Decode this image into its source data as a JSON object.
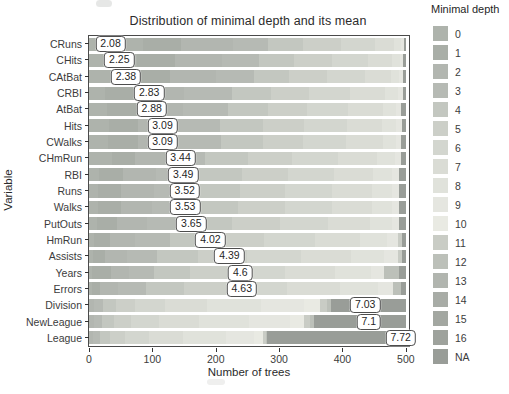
{
  "title": "Distribution of minimal depth and its mean",
  "legend": {
    "title": "Minimal depth",
    "labels": [
      "0",
      "1",
      "2",
      "3",
      "4",
      "5",
      "6",
      "7",
      "8",
      "9",
      "10",
      "11",
      "12",
      "13",
      "14",
      "15",
      "16",
      "NA"
    ]
  },
  "chart_data": {
    "type": "bar",
    "orientation": "horizontal",
    "stacked": true,
    "title": "Distribution of minimal depth and its mean",
    "xlabel": "Number of trees",
    "ylabel": "Variable",
    "xlim": [
      0,
      505
    ],
    "xticks": [
      0,
      100,
      200,
      300,
      400,
      500
    ],
    "total_trees_per_row": 500,
    "legend_title": "Minimal depth",
    "legend_position": "right",
    "grid": false,
    "depth_colors": {
      "0": "#aeb3ac",
      "1": "#a9aea7",
      "2": "#b2b6b0",
      "3": "#b6bab4",
      "4": "#c3c7c0",
      "5": "#cccfc8",
      "6": "#d3d6cf",
      "7": "#dadcd5",
      "8": "#e0e2db",
      "9": "#e5e6e0",
      "10": "#e9eae3",
      "11": "#c9ccc5",
      "12": "#bcc0b9",
      "13": "#b1b5af",
      "14": "#a8aca6",
      "15": "#a3a7a1",
      "16": "#9ea29c",
      "NA": "#999d98"
    },
    "rows": [
      {
        "variable": "CRuns",
        "mean_label": "2.08",
        "mean": 2.08,
        "segments": [
          [
            "0",
            85
          ],
          [
            "1",
            60
          ],
          [
            "2",
            82
          ],
          [
            "3",
            55
          ],
          [
            "4",
            55
          ],
          [
            "5",
            60
          ],
          [
            "6",
            55
          ],
          [
            "7",
            30
          ],
          [
            "8",
            10
          ],
          [
            "9",
            5
          ],
          [
            "NA",
            3
          ]
        ]
      },
      {
        "variable": "CHits",
        "mean_label": "2.25",
        "mean": 2.25,
        "segments": [
          [
            "0",
            75
          ],
          [
            "1",
            60
          ],
          [
            "2",
            75
          ],
          [
            "3",
            58
          ],
          [
            "4",
            55
          ],
          [
            "5",
            60
          ],
          [
            "6",
            58
          ],
          [
            "7",
            38
          ],
          [
            "8",
            12
          ],
          [
            "9",
            5
          ],
          [
            "NA",
            4
          ]
        ]
      },
      {
        "variable": "CAtBat",
        "mean_label": "2.38",
        "mean": 2.38,
        "segments": [
          [
            "0",
            70
          ],
          [
            "1",
            58
          ],
          [
            "2",
            72
          ],
          [
            "3",
            60
          ],
          [
            "4",
            56
          ],
          [
            "5",
            60
          ],
          [
            "6",
            60
          ],
          [
            "7",
            40
          ],
          [
            "8",
            14
          ],
          [
            "9",
            6
          ],
          [
            "NA",
            4
          ]
        ]
      },
      {
        "variable": "CRBI",
        "mean_label": "2.83",
        "mean": 2.83,
        "segments": [
          [
            "0",
            25
          ],
          [
            "1",
            55
          ],
          [
            "2",
            70
          ],
          [
            "3",
            75
          ],
          [
            "4",
            62
          ],
          [
            "5",
            60
          ],
          [
            "6",
            65
          ],
          [
            "7",
            55
          ],
          [
            "8",
            20
          ],
          [
            "9",
            8
          ],
          [
            "NA",
            5
          ]
        ]
      },
      {
        "variable": "AtBat",
        "mean_label": "2.88",
        "mean": 2.88,
        "segments": [
          [
            "0",
            28
          ],
          [
            "1",
            52
          ],
          [
            "2",
            68
          ],
          [
            "3",
            72
          ],
          [
            "4",
            62
          ],
          [
            "5",
            62
          ],
          [
            "6",
            65
          ],
          [
            "7",
            55
          ],
          [
            "8",
            20
          ],
          [
            "9",
            9
          ],
          [
            "NA",
            7
          ]
        ]
      },
      {
        "variable": "Hits",
        "mean_label": "3.09",
        "mean": 3.09,
        "segments": [
          [
            "0",
            32
          ],
          [
            "1",
            45
          ],
          [
            "2",
            60
          ],
          [
            "3",
            70
          ],
          [
            "4",
            68
          ],
          [
            "5",
            65
          ],
          [
            "6",
            68
          ],
          [
            "7",
            55
          ],
          [
            "8",
            22
          ],
          [
            "9",
            9
          ],
          [
            "NA",
            6
          ]
        ]
      },
      {
        "variable": "CWalks",
        "mean_label": "3.09",
        "mean": 3.09,
        "segments": [
          [
            "0",
            30
          ],
          [
            "1",
            48
          ],
          [
            "2",
            62
          ],
          [
            "3",
            68
          ],
          [
            "4",
            66
          ],
          [
            "5",
            64
          ],
          [
            "6",
            68
          ],
          [
            "7",
            58
          ],
          [
            "8",
            20
          ],
          [
            "9",
            9
          ],
          [
            "NA",
            7
          ]
        ]
      },
      {
        "variable": "CHmRun",
        "mean_label": "3.44",
        "mean": 3.44,
        "segments": [
          [
            "0",
            37
          ],
          [
            "1",
            36
          ],
          [
            "2",
            50
          ],
          [
            "3",
            60
          ],
          [
            "4",
            68
          ],
          [
            "5",
            70
          ],
          [
            "6",
            72
          ],
          [
            "7",
            62
          ],
          [
            "8",
            28
          ],
          [
            "9",
            10
          ],
          [
            "NA",
            7
          ]
        ]
      },
      {
        "variable": "RBI",
        "mean_label": "3.49",
        "mean": 3.49,
        "segments": [
          [
            "0",
            15
          ],
          [
            "1",
            38
          ],
          [
            "2",
            52
          ],
          [
            "3",
            65
          ],
          [
            "4",
            72
          ],
          [
            "5",
            72
          ],
          [
            "6",
            72
          ],
          [
            "7",
            62
          ],
          [
            "8",
            30
          ],
          [
            "9",
            12
          ],
          [
            "NA",
            10
          ]
        ]
      },
      {
        "variable": "Runs",
        "mean_label": "3.52",
        "mean": 3.52,
        "segments": [
          [
            "0",
            14
          ],
          [
            "1",
            36
          ],
          [
            "2",
            52
          ],
          [
            "3",
            64
          ],
          [
            "4",
            72
          ],
          [
            "5",
            72
          ],
          [
            "6",
            74
          ],
          [
            "7",
            62
          ],
          [
            "8",
            32
          ],
          [
            "9",
            12
          ],
          [
            "NA",
            10
          ]
        ]
      },
      {
        "variable": "Walks",
        "mean_label": "3.53",
        "mean": 3.53,
        "segments": [
          [
            "0",
            14
          ],
          [
            "1",
            36
          ],
          [
            "2",
            50
          ],
          [
            "3",
            64
          ],
          [
            "4",
            72
          ],
          [
            "5",
            74
          ],
          [
            "6",
            74
          ],
          [
            "7",
            62
          ],
          [
            "8",
            32
          ],
          [
            "9",
            12
          ],
          [
            "NA",
            10
          ]
        ]
      },
      {
        "variable": "PutOuts",
        "mean_label": "3.65",
        "mean": 3.65,
        "segments": [
          [
            "0",
            12
          ],
          [
            "1",
            32
          ],
          [
            "2",
            48
          ],
          [
            "3",
            62
          ],
          [
            "4",
            72
          ],
          [
            "5",
            76
          ],
          [
            "6",
            76
          ],
          [
            "7",
            66
          ],
          [
            "8",
            34
          ],
          [
            "9",
            12
          ],
          [
            "NA",
            10
          ]
        ]
      },
      {
        "variable": "HmRun",
        "mean_label": "4.02",
        "mean": 4.02,
        "segments": [
          [
            "0",
            8
          ],
          [
            "1",
            25
          ],
          [
            "2",
            40
          ],
          [
            "3",
            55
          ],
          [
            "4",
            70
          ],
          [
            "5",
            78
          ],
          [
            "6",
            80
          ],
          [
            "7",
            72
          ],
          [
            "8",
            42
          ],
          [
            "9",
            18
          ],
          [
            "11",
            6
          ],
          [
            "NA",
            6
          ]
        ]
      },
      {
        "variable": "Assists",
        "mean_label": "4.39",
        "mean": 4.39,
        "segments": [
          [
            "0",
            6
          ],
          [
            "1",
            20
          ],
          [
            "2",
            34
          ],
          [
            "3",
            48
          ],
          [
            "4",
            64
          ],
          [
            "5",
            78
          ],
          [
            "6",
            84
          ],
          [
            "7",
            80
          ],
          [
            "8",
            52
          ],
          [
            "9",
            22
          ],
          [
            "11",
            6
          ],
          [
            "NA",
            6
          ]
        ]
      },
      {
        "variable": "Years",
        "mean_label": "4.6",
        "mean": 4.6,
        "segments": [
          [
            "0",
            5
          ],
          [
            "1",
            30
          ],
          [
            "2",
            28
          ],
          [
            "3",
            40
          ],
          [
            "4",
            56
          ],
          [
            "5",
            70
          ],
          [
            "6",
            80
          ],
          [
            "7",
            80
          ],
          [
            "8",
            56
          ],
          [
            "9",
            20
          ],
          [
            "12",
            25
          ],
          [
            "NA",
            10
          ]
        ]
      },
      {
        "variable": "Errors",
        "mean_label": "4.63",
        "mean": 4.63,
        "segments": [
          [
            "0",
            4
          ],
          [
            "1",
            14
          ],
          [
            "2",
            28
          ],
          [
            "3",
            44
          ],
          [
            "4",
            60
          ],
          [
            "5",
            76
          ],
          [
            "6",
            86
          ],
          [
            "7",
            84
          ],
          [
            "8",
            60
          ],
          [
            "9",
            24
          ],
          [
            "12",
            12
          ],
          [
            "NA",
            8
          ]
        ]
      },
      {
        "variable": "Division",
        "mean_label": "7.03",
        "mean": 7.03,
        "segments": [
          [
            "2",
            8
          ],
          [
            "3",
            14
          ],
          [
            "4",
            20
          ],
          [
            "5",
            30
          ],
          [
            "6",
            48
          ],
          [
            "7",
            66
          ],
          [
            "8",
            86
          ],
          [
            "9",
            68
          ],
          [
            "10",
            25
          ],
          [
            "11",
            11
          ],
          [
            "12",
            6
          ],
          [
            "NA",
            118
          ]
        ]
      },
      {
        "variable": "NewLeague",
        "mean_label": "7.1",
        "mean": 7.1,
        "segments": [
          [
            "2",
            8
          ],
          [
            "3",
            13
          ],
          [
            "4",
            18
          ],
          [
            "5",
            28
          ],
          [
            "6",
            44
          ],
          [
            "7",
            62
          ],
          [
            "8",
            80
          ],
          [
            "9",
            64
          ],
          [
            "10",
            22
          ],
          [
            "11",
            10
          ],
          [
            "12",
            6
          ],
          [
            "NA",
            145
          ]
        ]
      },
      {
        "variable": "League",
        "mean_label": "7.72",
        "mean": 7.72,
        "segments": [
          [
            "2",
            7
          ],
          [
            "3",
            11
          ],
          [
            "4",
            15
          ],
          [
            "5",
            24
          ],
          [
            "6",
            38
          ],
          [
            "7",
            54
          ],
          [
            "8",
            68
          ],
          [
            "9",
            44
          ],
          [
            "10",
            14
          ],
          [
            "11",
            5
          ],
          [
            "12",
            1
          ],
          [
            "NA",
            219
          ]
        ]
      }
    ]
  }
}
